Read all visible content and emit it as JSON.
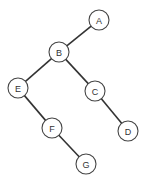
{
  "diagram": {
    "type": "binary-tree",
    "nodes": [
      {
        "id": "A",
        "label": "A",
        "x": 99,
        "y": 20
      },
      {
        "id": "B",
        "label": "B",
        "x": 59,
        "y": 52
      },
      {
        "id": "E",
        "label": "E",
        "x": 18,
        "y": 88
      },
      {
        "id": "C",
        "label": "C",
        "x": 95,
        "y": 91
      },
      {
        "id": "F",
        "label": "F",
        "x": 52,
        "y": 128
      },
      {
        "id": "D",
        "label": "D",
        "x": 128,
        "y": 131
      },
      {
        "id": "G",
        "label": "G",
        "x": 86,
        "y": 164
      }
    ],
    "edges": [
      [
        "A",
        "B"
      ],
      [
        "B",
        "E"
      ],
      [
        "B",
        "C"
      ],
      [
        "E",
        "F"
      ],
      [
        "C",
        "D"
      ],
      [
        "F",
        "G"
      ]
    ],
    "node_radius": 10
  }
}
